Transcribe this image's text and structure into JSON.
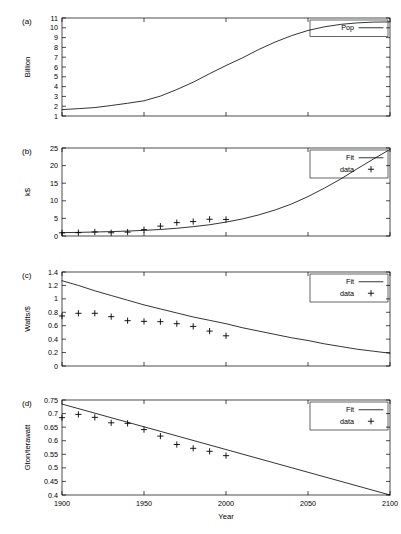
{
  "figure": {
    "xlabel": "Year",
    "xticks": [
      1900,
      1950,
      2000,
      2050,
      2100
    ],
    "xlim": [
      1900,
      2100
    ]
  },
  "chart_data": [
    {
      "type": "line",
      "panel": "(a)",
      "title": "",
      "xlabel": "",
      "ylabel": "Billion",
      "xlim": [
        1900,
        2100
      ],
      "ylim": [
        1,
        11
      ],
      "yticks": [
        1,
        2,
        3,
        4,
        5,
        6,
        7,
        8,
        9,
        10,
        11
      ],
      "xticks": [
        1900,
        1950,
        2000,
        2050,
        2100
      ],
      "grid": false,
      "legend": {
        "position": "top-right",
        "entries": [
          {
            "label": "Pop",
            "style": "line"
          }
        ]
      },
      "series": [
        {
          "name": "Pop",
          "style": "line",
          "x": [
            1900,
            1910,
            1920,
            1930,
            1940,
            1950,
            1960,
            1970,
            1980,
            1990,
            2000,
            2010,
            2020,
            2030,
            2040,
            2050,
            2060,
            2070,
            2080,
            2090,
            2100
          ],
          "values": [
            1.65,
            1.75,
            1.86,
            2.07,
            2.3,
            2.55,
            3.03,
            3.7,
            4.45,
            5.32,
            6.15,
            6.93,
            7.79,
            8.55,
            9.2,
            9.73,
            10.1,
            10.35,
            10.5,
            10.58,
            10.6
          ]
        }
      ]
    },
    {
      "type": "line",
      "panel": "(b)",
      "title": "",
      "xlabel": "",
      "ylabel": "k$",
      "xlim": [
        1900,
        2100
      ],
      "ylim": [
        0,
        25
      ],
      "yticks": [
        0,
        5,
        10,
        15,
        20,
        25
      ],
      "xticks": [
        1900,
        1950,
        2000,
        2050,
        2100
      ],
      "grid": false,
      "legend": {
        "position": "top-right",
        "entries": [
          {
            "label": "Fit",
            "style": "line"
          },
          {
            "label": "data",
            "style": "plus"
          }
        ]
      },
      "series": [
        {
          "name": "Fit",
          "style": "line",
          "x": [
            1900,
            1910,
            1920,
            1930,
            1940,
            1950,
            1960,
            1970,
            1980,
            1990,
            2000,
            2010,
            2020,
            2030,
            2040,
            2050,
            2060,
            2070,
            2080,
            2090,
            2100
          ],
          "values": [
            0.95,
            1.03,
            1.13,
            1.25,
            1.4,
            1.6,
            1.85,
            2.2,
            2.65,
            3.2,
            3.95,
            4.85,
            6.0,
            7.4,
            9.1,
            11.2,
            13.6,
            16.2,
            19.1,
            21.9,
            24.6
          ]
        },
        {
          "name": "data",
          "style": "plus",
          "x": [
            1900,
            1910,
            1920,
            1930,
            1940,
            1950,
            1960,
            1970,
            1980,
            1990,
            2000
          ],
          "values": [
            0.9,
            0.95,
            1.15,
            0.92,
            1.1,
            1.8,
            2.8,
            3.8,
            4.1,
            4.75,
            4.7
          ]
        }
      ]
    },
    {
      "type": "line",
      "panel": "(c)",
      "title": "",
      "xlabel": "",
      "ylabel": "Watts/$",
      "xlim": [
        1900,
        2100
      ],
      "ylim": [
        0,
        1.4
      ],
      "yticks": [
        0,
        0.2,
        0.4,
        0.6,
        0.8,
        1,
        1.2,
        1.4
      ],
      "xticks": [
        1900,
        1950,
        2000,
        2050,
        2100
      ],
      "grid": false,
      "legend": {
        "position": "top-right",
        "entries": [
          {
            "label": "Fit",
            "style": "line"
          },
          {
            "label": "data",
            "style": "plus"
          }
        ]
      },
      "series": [
        {
          "name": "Fit",
          "style": "line",
          "x": [
            1900,
            1910,
            1920,
            1930,
            1940,
            1950,
            1960,
            1970,
            1980,
            1990,
            2000,
            2010,
            2020,
            2030,
            2040,
            2050,
            2060,
            2070,
            2080,
            2090,
            2100
          ],
          "values": [
            1.27,
            1.2,
            1.12,
            1.05,
            0.98,
            0.91,
            0.85,
            0.79,
            0.73,
            0.68,
            0.63,
            0.57,
            0.52,
            0.47,
            0.42,
            0.38,
            0.33,
            0.29,
            0.25,
            0.22,
            0.19
          ]
        },
        {
          "name": "data",
          "style": "plus",
          "x": [
            1900,
            1910,
            1920,
            1930,
            1940,
            1950,
            1960,
            1970,
            1980,
            1990,
            2000
          ],
          "values": [
            0.745,
            0.785,
            0.785,
            0.735,
            0.675,
            0.665,
            0.66,
            0.63,
            0.59,
            0.52,
            0.45
          ]
        }
      ]
    },
    {
      "type": "line",
      "panel": "(d)",
      "title": "",
      "xlabel": "Year",
      "ylabel": "Gton/terawatt",
      "xlim": [
        1900,
        2100
      ],
      "ylim": [
        0.4,
        0.75
      ],
      "yticks": [
        0.4,
        0.45,
        0.5,
        0.55,
        0.6,
        0.65,
        0.7,
        0.75
      ],
      "xticks": [
        1900,
        1950,
        2000,
        2050,
        2100
      ],
      "grid": false,
      "legend": {
        "position": "top-right",
        "entries": [
          {
            "label": "Fit",
            "style": "line"
          },
          {
            "label": "data",
            "style": "plus"
          }
        ]
      },
      "series": [
        {
          "name": "Fit",
          "style": "line",
          "x": [
            1900,
            2100
          ],
          "values": [
            0.735,
            0.4
          ]
        },
        {
          "name": "data",
          "style": "plus",
          "x": [
            1900,
            1910,
            1920,
            1930,
            1940,
            1950,
            1960,
            1970,
            1980,
            1990,
            2000
          ],
          "values": [
            0.685,
            0.697,
            0.686,
            0.666,
            0.664,
            0.641,
            0.617,
            0.586,
            0.572,
            0.561,
            0.545
          ]
        }
      ]
    }
  ]
}
